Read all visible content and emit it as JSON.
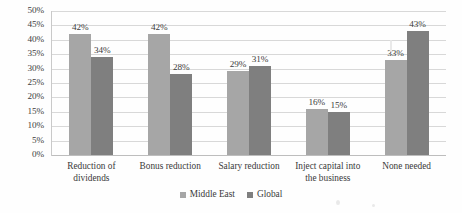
{
  "chart_data": {
    "type": "bar",
    "title": "",
    "subtitle": "",
    "xlabel": "",
    "ylabel": "",
    "ylim": [
      0,
      50
    ],
    "ytick_step": 5,
    "ytick_labels": [
      "50%",
      "45%",
      "40%",
      "35%",
      "30%",
      "25%",
      "20%",
      "15%",
      "10%",
      "5%",
      "0%"
    ],
    "ytick_values": [
      50,
      45,
      40,
      35,
      30,
      25,
      20,
      15,
      10,
      5,
      0
    ],
    "grid": true,
    "legend_position": "bottom-center",
    "value_suffix": "%",
    "categories": [
      "Reduction of dividends",
      "Bonus reduction",
      "Salary reduction",
      "Inject capital into the business",
      "None needed"
    ],
    "series": [
      {
        "name": "Middle East",
        "color": "#a6a6a6",
        "values": [
          42,
          42,
          29,
          16,
          33
        ],
        "labels": [
          "42%",
          "42%",
          "29%",
          "16%",
          "33%"
        ]
      },
      {
        "name": "Global",
        "color": "#7f7f7f",
        "values": [
          34,
          28,
          31,
          15,
          43
        ],
        "labels": [
          "34%",
          "28%",
          "31%",
          "15%",
          "43%"
        ]
      }
    ]
  }
}
